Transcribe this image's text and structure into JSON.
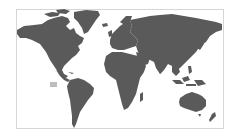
{
  "map": {
    "type": "world-map",
    "projection": "equirectangular-like",
    "land_color": "#5a5a5a",
    "water_color": "#ffffff",
    "frame_color": "#d6d6d6",
    "highlight_color": "#bdbdbd",
    "regions": [
      {
        "name": "North America"
      },
      {
        "name": "Greenland"
      },
      {
        "name": "South America"
      },
      {
        "name": "Europe"
      },
      {
        "name": "Africa"
      },
      {
        "name": "Asia"
      },
      {
        "name": "Australia"
      },
      {
        "name": "New Zealand"
      }
    ],
    "marker": {
      "shape": "rectangle",
      "location": "Pacific Ocean (near Hawaii)"
    }
  }
}
